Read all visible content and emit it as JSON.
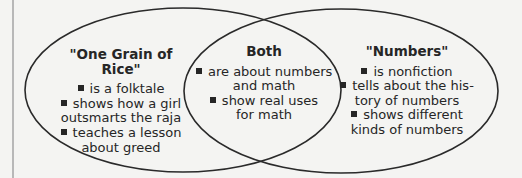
{
  "diagram": {
    "type": "venn",
    "left": {
      "title": "\"One Grain of Rice\"",
      "items": [
        [
          "is a folktale"
        ],
        [
          "shows how a girl",
          "outsmarts the raja"
        ],
        [
          "teaches a lesson",
          "about greed"
        ]
      ]
    },
    "both": {
      "title": "Both",
      "items": [
        [
          "are about numbers",
          "and math"
        ],
        [
          "show real uses",
          "for math"
        ]
      ]
    },
    "right": {
      "title": "\"Numbers\"",
      "items": [
        [
          "is nonfiction"
        ],
        [
          "tells about the his-",
          "tory of numbers"
        ],
        [
          "shows different",
          "kinds of numbers"
        ]
      ]
    },
    "colors": {
      "stroke": "#2a2a2a",
      "background": "#f4f4f2",
      "text": "#262626",
      "margin_line": "#b8b8b8"
    }
  }
}
